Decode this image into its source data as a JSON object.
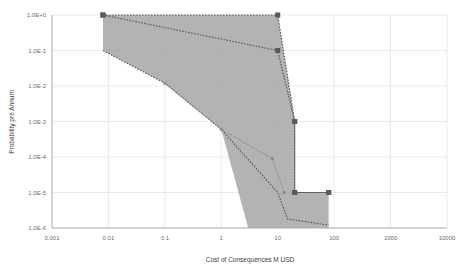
{
  "chart_data": {
    "type": "line",
    "title": "",
    "xlabel": "Cost of Consequences M USD",
    "ylabel": "Probability pre Annum",
    "xscale": "log",
    "yscale": "log",
    "xlim": [
      0.001,
      10000
    ],
    "ylim": [
      1e-06,
      1
    ],
    "grid": true,
    "legend": "none",
    "xticks": [
      "0.001",
      "0.01",
      "0.1",
      "1",
      "10",
      "100",
      "1000",
      "10000"
    ],
    "xtick_values": [
      0.001,
      0.01,
      0.1,
      1,
      10,
      100,
      1000,
      10000
    ],
    "yticks": [
      "1.0E+0",
      "1.0E-1",
      "1.0E-2",
      "1.0E-3",
      "1.0E-4",
      "1.0E-5",
      "1.0E-6"
    ],
    "ytick_values": [
      1,
      0.1,
      0.01,
      0.001,
      0.0001,
      1e-05,
      1e-06
    ],
    "band": {
      "name": "risk-envelope",
      "fill": "#a6a6a6",
      "upper": [
        {
          "x": 0.008,
          "y": 1.0
        },
        {
          "x": 10.0,
          "y": 1.0
        },
        {
          "x": 20.0,
          "y": 0.001
        },
        {
          "x": 20.0,
          "y": 1e-05
        },
        {
          "x": 80.0,
          "y": 1e-05
        }
      ],
      "lower": [
        {
          "x": 0.008,
          "y": 0.1
        },
        {
          "x": 0.1,
          "y": 0.012
        },
        {
          "x": 1.0,
          "y": 0.0006
        },
        {
          "x": 3.0,
          "y": 1e-06
        },
        {
          "x": 80.0,
          "y": 1e-06
        }
      ]
    },
    "series": [
      {
        "name": "Upper bound",
        "color": "#595959",
        "style": "dotted",
        "marker": "square",
        "points": [
          {
            "x": 0.008,
            "y": 1.0
          },
          {
            "x": 10.0,
            "y": 1.0
          },
          {
            "x": 20.0,
            "y": 0.001
          },
          {
            "x": 20.0,
            "y": 1e-05
          },
          {
            "x": 80.0,
            "y": 1e-05
          }
        ]
      },
      {
        "name": "Best estimate",
        "color": "#595959",
        "style": "dotted",
        "marker": "square",
        "points": [
          {
            "x": 0.008,
            "y": 1.0
          },
          {
            "x": 10.0,
            "y": 0.1
          },
          {
            "x": 20.0,
            "y": 0.001
          },
          {
            "x": 20.0,
            "y": 1e-05
          },
          {
            "x": 80.0,
            "y": 1e-05
          }
        ]
      },
      {
        "name": "Lower bound",
        "color": "#595959",
        "style": "dotted",
        "marker": "none",
        "points": [
          {
            "x": 0.008,
            "y": 0.1
          },
          {
            "x": 0.1,
            "y": 0.012
          },
          {
            "x": 1.0,
            "y": 0.0006
          },
          {
            "x": 10.0,
            "y": 1e-05
          },
          {
            "x": 15.0,
            "y": 1.8e-06
          },
          {
            "x": 80.0,
            "y": 1.2e-06
          }
        ]
      },
      {
        "name": "Inner trace",
        "color": "#8c8c8c",
        "style": "solid-thin",
        "marker": "small-square",
        "points": [
          {
            "x": 0.1,
            "y": 0.012
          },
          {
            "x": 1.0,
            "y": 0.0006
          },
          {
            "x": 8.0,
            "y": 9e-05
          },
          {
            "x": 13.0,
            "y": 1e-05
          }
        ]
      }
    ]
  }
}
